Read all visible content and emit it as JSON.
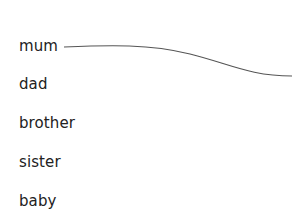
{
  "words": [
    {
      "label": "mum",
      "top": 37
    },
    {
      "label": "dad",
      "top": 75
    },
    {
      "label": "brother",
      "top": 114
    },
    {
      "label": "sister",
      "top": 153
    },
    {
      "label": "baby",
      "top": 192
    }
  ],
  "connector": {
    "from": "mum",
    "stroke": "#555555"
  }
}
